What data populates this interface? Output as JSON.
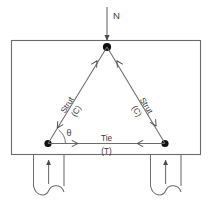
{
  "figure": {
    "kind": "strut-and-tie-diagram",
    "load": {
      "label": "N",
      "direction": "down",
      "icon": "down-arrow-icon"
    },
    "angle": {
      "label": "θ"
    },
    "members": [
      {
        "id": "left-strut",
        "label": "Strut",
        "force_label": "(C)",
        "force_type": "compression"
      },
      {
        "id": "right-strut",
        "label": "Strut",
        "force_label": "(C)",
        "force_type": "compression"
      },
      {
        "id": "bottom-tie",
        "label": "Tie",
        "force_label": "(T)",
        "force_type": "tension"
      }
    ],
    "supports": [
      {
        "id": "left-support",
        "reaction_icon": "up-arrow-icon",
        "break_icon": "break-symbol-icon"
      },
      {
        "id": "right-support",
        "reaction_icon": "up-arrow-icon",
        "break_icon": "break-symbol-icon"
      }
    ],
    "colors": {
      "line": "#555555",
      "node": "#111111",
      "text": "#3a3a3a",
      "background": "#ffffff"
    }
  }
}
